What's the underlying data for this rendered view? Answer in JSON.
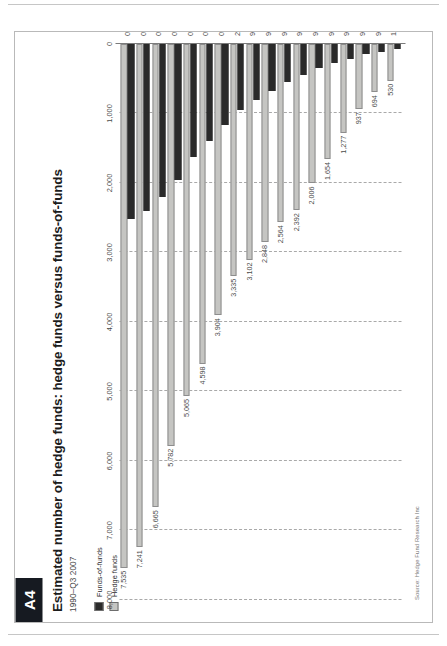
{
  "page": {
    "badge": "A4",
    "title": "Estimated number of hedge funds: hedge funds versus funds-of-funds",
    "subtitle": "1990–Q3 2007",
    "source": "Source: Hedge Fund Research Inc"
  },
  "legend": {
    "items": [
      {
        "label": "Funds-of-funds",
        "color": "#2a2a2a"
      },
      {
        "label": "Hedge funds",
        "color": "#c5c5c2"
      }
    ]
  },
  "colors": {
    "hedge_funds": "#c5c5c2",
    "funds_of_funds": "#2a2a2a",
    "grid": "#a9a9a9",
    "axis": "#7b7b7b",
    "badge_bg": "#161a21",
    "text": "#4a4a4a"
  },
  "chart_data": {
    "type": "bar",
    "orientation": "horizontal",
    "title": "Estimated number of hedge funds: hedge funds versus funds-of-funds",
    "subtitle": "1990–Q3 2007",
    "xlabel": "",
    "ylabel": "",
    "xlim": [
      0,
      8000
    ],
    "xticks": [
      0,
      1000,
      2000,
      3000,
      4000,
      5000,
      6000,
      7000,
      8000
    ],
    "xticklabels": [
      "0",
      "1,000",
      "2,000",
      "3,000",
      "4,000",
      "5,000",
      "6,000",
      "7,000",
      "8,000"
    ],
    "grid": true,
    "legend_position": "top-left",
    "categories": [
      "1990",
      "91",
      "92",
      "93",
      "94",
      "95",
      "96",
      "97",
      "98",
      "99",
      "2000",
      "01",
      "02",
      "03",
      "04",
      "05",
      "06",
      "07"
    ],
    "category_note": "end Sep",
    "category_note_index": 17,
    "series": [
      {
        "name": "Hedge funds",
        "color": "#c5c5c2",
        "values": [
          530,
          694,
          937,
          1277,
          1654,
          2006,
          2392,
          2564,
          2848,
          3102,
          3335,
          3904,
          4598,
          5065,
          5782,
          6665,
          7241,
          7535
        ],
        "labels": [
          "530",
          "694",
          "937",
          "1,277",
          "1,654",
          "2,006",
          "2,392",
          "2,564",
          "2,848",
          "3,102",
          "3,335",
          "3,904",
          "4,598",
          "5,065",
          "5,782",
          "6,665",
          "7,241",
          "7,535"
        ]
      },
      {
        "name": "Funds-of-funds",
        "color": "#2a2a2a",
        "values": [
          70,
          110,
          150,
          210,
          280,
          350,
          440,
          550,
          670,
          800,
          950,
          1160,
          1400,
          1630,
          1950,
          2200,
          2400,
          2520
        ],
        "labels": []
      }
    ]
  }
}
